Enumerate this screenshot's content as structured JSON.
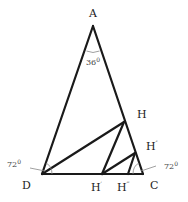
{
  "diagram": {
    "type": "geometry",
    "colors": {
      "stroke": "#1a1a1a",
      "text": "#222222",
      "angle_text": "#444444",
      "arc": "#888888"
    },
    "points": {
      "A": {
        "label": "A",
        "x": 93,
        "y": 26
      },
      "D": {
        "label": "D",
        "x": 42,
        "y": 174
      },
      "C": {
        "label": "C",
        "x": 143,
        "y": 174
      },
      "H": {
        "label": "H",
        "x": 124,
        "y": 122
      },
      "H1": {
        "label": "H",
        "prime": "′",
        "x": 102,
        "y": 174
      },
      "H2": {
        "label": "H",
        "prime": "″",
        "x": 135,
        "y": 153
      },
      "H3": {
        "label": "H",
        "prime": "‴",
        "x": 128,
        "y": 174
      }
    },
    "segments": [
      [
        "A",
        "D"
      ],
      [
        "A",
        "C"
      ],
      [
        "D",
        "C"
      ],
      [
        "D",
        "H"
      ],
      [
        "H",
        "H1"
      ],
      [
        "H1",
        "H2"
      ],
      [
        "H2",
        "H3"
      ]
    ],
    "angles": {
      "A": {
        "value": "36",
        "unit": "0"
      },
      "D": {
        "value": "72",
        "unit": "0"
      },
      "C": {
        "value": "72",
        "unit": "0"
      }
    }
  }
}
